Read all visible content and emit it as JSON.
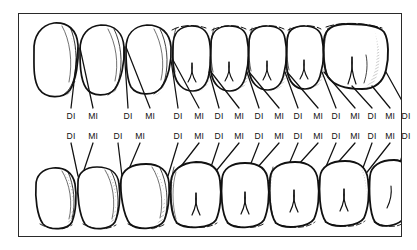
{
  "figure": {
    "background_color": "#ffffff",
    "frame_color": "#2a2a2a",
    "ink_color": "#111111",
    "hatch_color": "#3a3a3a"
  },
  "upper_arch": {
    "name": "maxillary-arch",
    "tooth_count": 10,
    "teeth": [
      {
        "type": "central-incisor",
        "cx": 52,
        "cusps": 0
      },
      {
        "type": "lateral-incisor",
        "cx": 94,
        "cusps": 0
      },
      {
        "type": "canine",
        "cx": 134,
        "cusps": 0
      },
      {
        "type": "first-premolar",
        "cx": 172,
        "cusps": 2
      },
      {
        "type": "second-premolar",
        "cx": 206,
        "cusps": 2
      },
      {
        "type": "first-molar",
        "cx": 243,
        "cusps": 2
      },
      {
        "type": "second-molar",
        "cx": 276,
        "cusps": 2
      },
      {
        "type": "third-molar",
        "cx": 310,
        "cusps": 2
      },
      {
        "type": "posterior-molar",
        "cx": 348,
        "cusps": 3
      },
      {
        "type": "terminal-molar",
        "cx": 382,
        "cusps": 2
      }
    ],
    "labels": [
      {
        "text": "DI",
        "x": 71
      },
      {
        "text": "MI",
        "x": 93
      },
      {
        "text": "DI",
        "x": 128
      },
      {
        "text": "MI",
        "x": 150
      },
      {
        "text": "DI",
        "x": 178
      },
      {
        "text": "MI",
        "x": 199
      },
      {
        "text": "DI",
        "x": 219
      },
      {
        "text": "MI",
        "x": 239
      },
      {
        "text": "DI",
        "x": 259
      },
      {
        "text": "MI",
        "x": 279
      },
      {
        "text": "DI",
        "x": 298
      },
      {
        "text": "MI",
        "x": 318
      },
      {
        "text": "DI",
        "x": 336
      },
      {
        "text": "MI",
        "x": 355
      },
      {
        "text": "DI",
        "x": 372
      },
      {
        "text": "MI",
        "x": 390
      },
      {
        "text": "DI",
        "x": 406
      }
    ]
  },
  "lower_arch": {
    "name": "mandibular-arch",
    "tooth_count": 9,
    "teeth": [
      {
        "type": "central-incisor",
        "cx": 55,
        "cusps": 0
      },
      {
        "type": "lateral-incisor",
        "cx": 97,
        "cusps": 0
      },
      {
        "type": "canine",
        "cx": 140,
        "cusps": 0
      },
      {
        "type": "first-premolar",
        "cx": 186,
        "cusps": 2
      },
      {
        "type": "second-premolar",
        "cx": 224,
        "cusps": 2
      },
      {
        "type": "first-molar",
        "cx": 262,
        "cusps": 2
      },
      {
        "type": "second-molar",
        "cx": 300,
        "cusps": 2
      },
      {
        "type": "third-molar",
        "cx": 338,
        "cusps": 2
      },
      {
        "type": "terminal-molar",
        "cx": 376,
        "cusps": 1
      }
    ],
    "labels": [
      {
        "text": "DI",
        "x": 71
      },
      {
        "text": "MI",
        "x": 93
      },
      {
        "text": "DI",
        "x": 118
      },
      {
        "text": "MI",
        "x": 140
      },
      {
        "text": "DI",
        "x": 178
      },
      {
        "text": "MI",
        "x": 199
      },
      {
        "text": "DI",
        "x": 219
      },
      {
        "text": "MI",
        "x": 239
      },
      {
        "text": "DI",
        "x": 259
      },
      {
        "text": "MI",
        "x": 279
      },
      {
        "text": "DI",
        "x": 298
      },
      {
        "text": "MI",
        "x": 318
      },
      {
        "text": "DI",
        "x": 336
      },
      {
        "text": "MI",
        "x": 355
      },
      {
        "text": "DI",
        "x": 372
      },
      {
        "text": "MI",
        "x": 390
      },
      {
        "text": "DI",
        "x": 406
      }
    ]
  },
  "legend": {
    "di_meaning": "DI",
    "mi_meaning": "MI"
  }
}
